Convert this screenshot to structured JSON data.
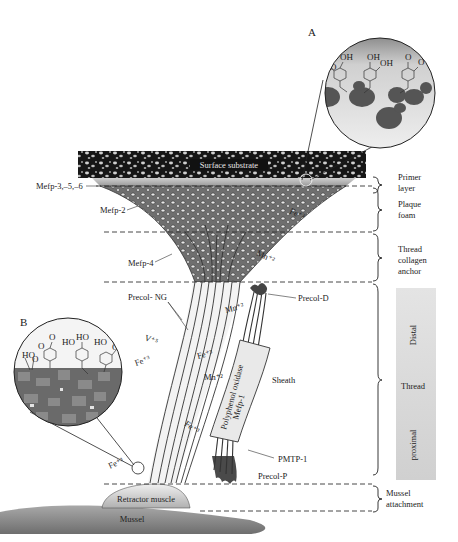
{
  "figure": {
    "panel_labels": {
      "a": "A",
      "b": "B"
    },
    "surface_label": "Surface substrate",
    "protein_labels": {
      "mefp356": "Mefp-3,–5,–6",
      "mefp2": "Mefp-2",
      "mefp4": "Mefp-4",
      "precol_ng": "Precol- NG",
      "precol_d": "Precol-D",
      "precol_p": "Precol-P",
      "pmtp1": "PMTP-1",
      "sheath": "Sheath",
      "polyphenol": "Polyphenol oxidase",
      "mefp1": "Mefp-1"
    },
    "ion_labels": {
      "fe3_plaque": "Fe⁺³",
      "mn2_anchor": "Mn⁺²",
      "mn2_distal": "Mn⁺²",
      "v5": "V⁺⁵",
      "fe3_left": "Fe⁺³",
      "fe3_mid": "Fe⁺³",
      "mn2_mid": "Mn⁺²",
      "fe3_low": "Fe⁺³",
      "fe3_bottom": "Fe⁺³"
    },
    "base_labels": {
      "retractor": "Retractor muscle",
      "mussel": "Mussel"
    },
    "regions": [
      {
        "line1": "Primer",
        "line2": "layer",
        "line3": ""
      },
      {
        "line1": "Plaque",
        "line2": "foam",
        "line3": ""
      },
      {
        "line1": "Thread",
        "line2": "collagen",
        "line3": "anchor"
      },
      {
        "line1": "Thread",
        "line2": "",
        "line3": ""
      },
      {
        "line1": "Mussel",
        "line2": "attachment",
        "line3": ""
      }
    ],
    "thread_subregions": {
      "distal": "Distal",
      "proximal": "proximal"
    },
    "chem_a": {
      "oh1": "OH",
      "o1": "O",
      "oh2": "OH",
      "oh3": "OH",
      "o2": "O",
      "o3": "O"
    },
    "chem_b": {
      "o1": "O",
      "o2": "O",
      "ho1": "HO",
      "ho2": "HO",
      "ho3": "HO",
      "ho4": "HO",
      "o3": "O",
      "o4": "O"
    },
    "colors": {
      "substrate": "#1a1a1a",
      "plaque": "#8a8a8a",
      "thread": "#e6e6e6",
      "particle": "#555555",
      "mussel": "#8c8c8c"
    }
  }
}
